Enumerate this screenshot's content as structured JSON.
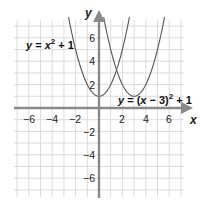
{
  "chart_data": {
    "type": "line",
    "title": "",
    "xlabel": "x",
    "ylabel": "y",
    "xlim": [
      -7,
      7
    ],
    "ylim": [
      -7.5,
      7.5
    ],
    "grid": true,
    "x_ticks": [
      -6,
      -4,
      -2,
      2,
      4,
      6
    ],
    "y_ticks": [
      6,
      4,
      2,
      -2,
      -4,
      -6
    ],
    "x_tick_labels": [
      "−6",
      "−4",
      "−2",
      "2",
      "4",
      "6"
    ],
    "y_tick_labels": [
      "6",
      "4",
      "2",
      "−2",
      "−4",
      "−6"
    ],
    "series": [
      {
        "name": "y = x^2 + 1",
        "label_text": "y = x² + 1",
        "function": "x^2 + 1",
        "vertex": [
          0,
          1
        ],
        "points": [
          [
            -2.6,
            7.76
          ],
          [
            -2,
            5
          ],
          [
            -1,
            2
          ],
          [
            0,
            1
          ],
          [
            1,
            2
          ],
          [
            2,
            5
          ],
          [
            2.6,
            7.76
          ]
        ]
      },
      {
        "name": "y = (x - 3)^2 + 1",
        "label_text": "y = (x − 3)² + 1",
        "function": "(x-3)^2 + 1",
        "vertex": [
          3,
          1
        ],
        "points": [
          [
            0.4,
            7.76
          ],
          [
            1,
            5
          ],
          [
            2,
            2
          ],
          [
            3,
            1
          ],
          [
            4,
            2
          ],
          [
            5,
            5
          ],
          [
            5.6,
            7.76
          ]
        ]
      }
    ],
    "colors": {
      "grid": "#dcdcdc",
      "axis": "#8a8a8a",
      "curve": "#555555",
      "text": "#222222"
    }
  },
  "labels": {
    "x_axis": "x",
    "y_axis": "y",
    "eq1": {
      "y": "y",
      "eq": " = ",
      "x": "x",
      "sup": "2",
      "rest": " + 1"
    },
    "eq2": {
      "y": "y",
      "eq": " = (",
      "x": "x",
      "mid": " − 3)",
      "sup": "2",
      "rest": " + 1"
    },
    "ticks_x": [
      "−6",
      "−4",
      "−2",
      "2",
      "4",
      "6"
    ],
    "ticks_y": [
      "6",
      "4",
      "2",
      "−2",
      "−4",
      "−6"
    ]
  }
}
